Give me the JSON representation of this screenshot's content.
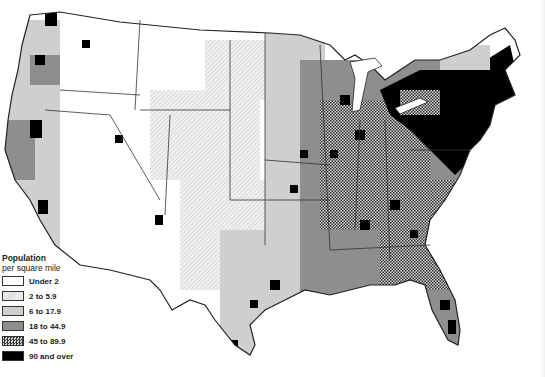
{
  "legend": {
    "title_line1": "Population",
    "title_line2": "per square mile",
    "items": [
      {
        "label": "Under 2",
        "class": "s0"
      },
      {
        "label": "2 to 5.9",
        "class": "s1"
      },
      {
        "label": "6 to 17.9",
        "class": "s2"
      },
      {
        "label": "18 to 44.9",
        "class": "s3"
      },
      {
        "label": "45 to 89.9",
        "class": "s4"
      },
      {
        "label": "90 and over",
        "class": "s5"
      }
    ]
  },
  "map": {
    "subject": "Population density by county, United States",
    "colors": {
      "under_2": "#ffffff",
      "2_to_5_9": "#e6e6e6",
      "6_to_17_9": "#cfcfcf",
      "18_to_44_9": "#8e8e8e",
      "45_to_89_9": "#555555",
      "90_and_over": "#000000",
      "boundary": "#222222"
    }
  }
}
